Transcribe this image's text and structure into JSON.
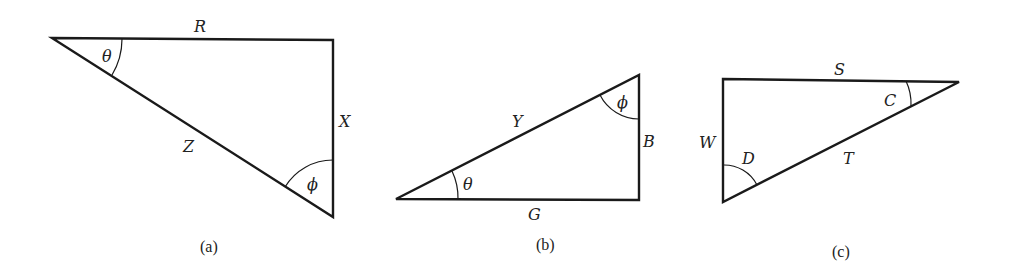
{
  "figures": [
    {
      "id": "a",
      "caption": "(a)",
      "sides": {
        "top": "R",
        "right": "X",
        "hypotenuse": "Z"
      },
      "angles": {
        "left": "θ",
        "bottom": "ϕ"
      }
    },
    {
      "id": "b",
      "caption": "(b)",
      "sides": {
        "hypotenuse": "Y",
        "right": "B",
        "bottom": "G"
      },
      "angles": {
        "left": "θ",
        "top": "ϕ"
      }
    },
    {
      "id": "c",
      "caption": "(c)",
      "sides": {
        "top": "S",
        "left": "W",
        "hypotenuse": "T"
      },
      "angles": {
        "right": "C",
        "bottom": "D"
      }
    }
  ],
  "colors": {
    "stroke": "#1a1a1a",
    "background": "#ffffff"
  }
}
